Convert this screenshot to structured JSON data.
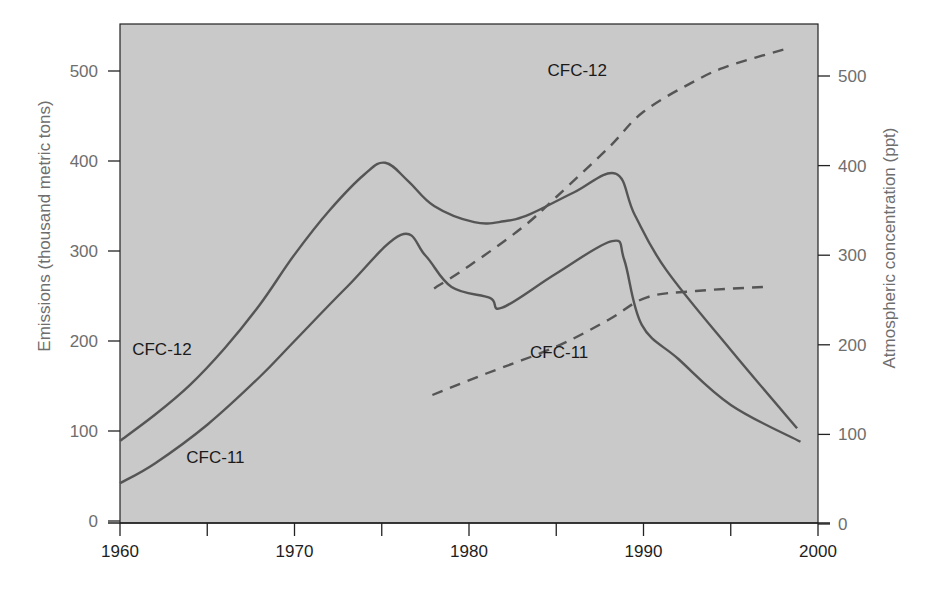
{
  "chart_data": {
    "type": "line",
    "title": "",
    "xlabel": "",
    "ylabel": "Emissions (thousand metric tons)",
    "y2label": "Atmospheric concentration (ppt)",
    "xlim": [
      1960,
      2000
    ],
    "ylim": [
      0,
      550
    ],
    "y2lim": [
      0,
      550
    ],
    "x_ticks": [
      1960,
      1970,
      1980,
      1990,
      2000
    ],
    "x_minor_ticks": [
      1965,
      1975,
      1985,
      1995
    ],
    "y_ticks": [
      0,
      100,
      200,
      300,
      400,
      500
    ],
    "y2_ticks": [
      0,
      100,
      200,
      300,
      400,
      500
    ],
    "grid": false,
    "legend": "none (inline labels)",
    "colors": {
      "background": "#c9c9c9",
      "line": "#555555",
      "axis": "#222222"
    },
    "series": [
      {
        "name": "CFC-12",
        "kind": "emissions",
        "axis": "left",
        "style": "solid",
        "points": [
          [
            1960,
            89
          ],
          [
            1962,
            118
          ],
          [
            1964,
            151
          ],
          [
            1966,
            192
          ],
          [
            1968,
            240
          ],
          [
            1970,
            296
          ],
          [
            1972,
            345
          ],
          [
            1974,
            385
          ],
          [
            1975.2,
            398
          ],
          [
            1976.5,
            378
          ],
          [
            1978,
            350
          ],
          [
            1980.3,
            332
          ],
          [
            1982,
            333
          ],
          [
            1983.5,
            341
          ],
          [
            1986,
            365
          ],
          [
            1988.4,
            386
          ],
          [
            1989.5,
            340
          ],
          [
            1991.3,
            279
          ],
          [
            1995,
            190
          ],
          [
            1998.8,
            103
          ]
        ]
      },
      {
        "name": "CFC-11",
        "kind": "emissions",
        "axis": "left",
        "style": "solid",
        "points": [
          [
            1960,
            42
          ],
          [
            1962,
            64
          ],
          [
            1965,
            107
          ],
          [
            1968,
            160
          ],
          [
            1970,
            200
          ],
          [
            1973,
            260
          ],
          [
            1976.1,
            318
          ],
          [
            1977.5,
            295
          ],
          [
            1979,
            260
          ],
          [
            1981.2,
            248
          ],
          [
            1981.9,
            237
          ],
          [
            1985,
            275
          ],
          [
            1988.2,
            311
          ],
          [
            1988.9,
            290
          ],
          [
            1989.9,
            218
          ],
          [
            1992,
            180
          ],
          [
            1995,
            129
          ],
          [
            1999,
            88
          ]
        ]
      },
      {
        "name": "CFC-12",
        "kind": "concentration",
        "axis": "right",
        "style": "dashed",
        "points": [
          [
            1978,
            263
          ],
          [
            1980,
            288
          ],
          [
            1983,
            330
          ],
          [
            1985,
            365
          ],
          [
            1988,
            420
          ],
          [
            1990,
            460
          ],
          [
            1993,
            495
          ],
          [
            1995,
            512
          ],
          [
            1998.3,
            531
          ]
        ]
      },
      {
        "name": "CFC-11",
        "kind": "concentration",
        "axis": "right",
        "style": "dashed",
        "points": [
          [
            1977.9,
            144
          ],
          [
            1981,
            168
          ],
          [
            1985,
            198
          ],
          [
            1988,
            228
          ],
          [
            1990.2,
            253
          ],
          [
            1993,
            260
          ],
          [
            1997.2,
            265
          ]
        ]
      }
    ],
    "annotations": [
      {
        "text": "CFC-12",
        "x": 1960.7,
        "y": 185,
        "axis": "left"
      },
      {
        "text": "CFC-11",
        "x": 1963.8,
        "y": 65,
        "axis": "left"
      },
      {
        "text": "CFC-12",
        "x": 1984.5,
        "y": 500,
        "axis": "right"
      },
      {
        "text": "CFC-11",
        "x": 1983.5,
        "y": 185,
        "axis": "right"
      }
    ]
  },
  "labels": {
    "y_left": "Emissions (thousand metric tons)",
    "y_right": "Atmospheric concentration (ppt)"
  }
}
